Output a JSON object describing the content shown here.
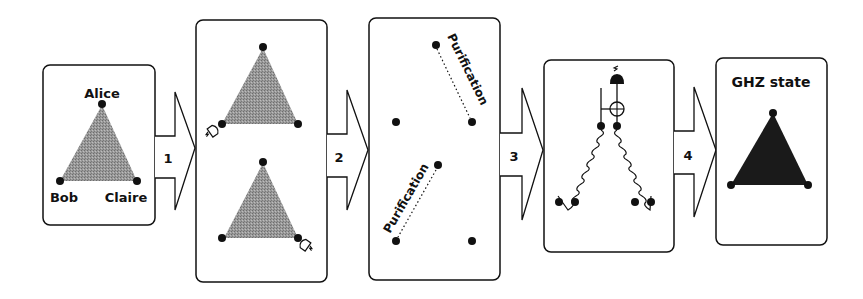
{
  "diagram": {
    "colors": {
      "ink": "#111111",
      "shaded": "#8a8a8a",
      "ghz": "#1a1a1a",
      "background": "#ffffff"
    },
    "panel1": {
      "labels": {
        "top": "Alice",
        "left": "Bob",
        "right": "Claire"
      }
    },
    "arrows": [
      {
        "label": "1"
      },
      {
        "label": "2"
      },
      {
        "label": "3"
      },
      {
        "label": "4"
      }
    ],
    "panel2": {
      "triangles": 2,
      "detector_icons": 2
    },
    "panel3": {
      "purification_labels": [
        "Purification",
        "Purification"
      ]
    },
    "panel4": {
      "gate": "CNOT with measurement",
      "wavy_links": 2
    },
    "panel5": {
      "title": "GHZ state"
    }
  }
}
